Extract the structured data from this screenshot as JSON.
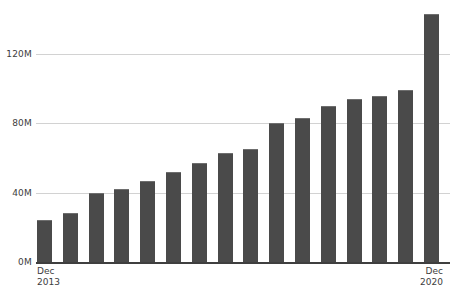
{
  "chart_data": {
    "type": "bar",
    "title": "",
    "subtitle": "",
    "xlabel": "",
    "ylabel": "",
    "ylim": [
      0,
      144
    ],
    "grid": true,
    "legend": null,
    "y_ticks": [
      {
        "value": 0,
        "label": "0M"
      },
      {
        "value": 40,
        "label": "40M"
      },
      {
        "value": 80,
        "label": "80M"
      },
      {
        "value": 120,
        "label": "120M"
      }
    ],
    "x_axis_labels": [
      {
        "line1": "Dec",
        "line2": "2013",
        "align": "left"
      },
      {
        "line1": "Dec",
        "line2": "2020",
        "align": "right"
      }
    ],
    "categories": [
      "Dec 2013",
      "Jun 2014",
      "Dec 2014",
      "Jun 2015",
      "Dec 2015",
      "Jun 2016",
      "Dec 2016",
      "Jun 2017",
      "Dec 2017",
      "Jun 2018",
      "Dec 2018",
      "Jun 2019",
      "Dec 2019",
      "Jun 2020",
      "Dec 2020",
      "Dec 2020"
    ],
    "values": [
      24,
      28,
      40,
      42,
      47,
      52,
      57,
      63,
      65,
      80,
      83,
      90,
      94,
      96,
      99,
      143
    ],
    "value_unit": "M",
    "bar_color": "#4a4a4a",
    "gridline_color": "#d2d2d2",
    "axis_color": "#3f3f3f",
    "background_color": "#ffffff"
  }
}
